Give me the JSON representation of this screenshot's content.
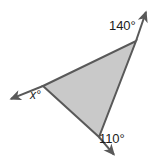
{
  "figure": {
    "kind": "geometry-diagram",
    "background_color": "#ffffff",
    "triangle": {
      "fill_color": "#c9c9c9",
      "stroke_color": "#595959",
      "stroke_width": 2,
      "vertices": [
        {
          "name": "left-vertex",
          "x": 43,
          "y": 86
        },
        {
          "name": "top-right-vertex",
          "x": 136,
          "y": 41
        },
        {
          "name": "bottom-vertex",
          "x": 99,
          "y": 137
        }
      ]
    },
    "rays": [
      {
        "name": "ray-upper-right",
        "from_vertex": "top-right-vertex",
        "from": {
          "x": 136,
          "y": 41
        },
        "to": {
          "x": 147,
          "y": 9
        },
        "arrowhead": "end"
      },
      {
        "name": "ray-lower-left",
        "from_vertex": "left-vertex",
        "from": {
          "x": 43,
          "y": 86
        },
        "to": {
          "x": 8,
          "y": 100
        },
        "arrowhead": "end"
      },
      {
        "name": "ray-lower-right",
        "from_vertex": "bottom-vertex",
        "from": {
          "x": 99,
          "y": 137
        },
        "to": {
          "x": 116,
          "y": 157
        },
        "arrowhead": "end"
      }
    ],
    "labels": {
      "top_right_angle": "140°",
      "bottom_angle": "110°",
      "unknown_angle": "x°"
    }
  }
}
